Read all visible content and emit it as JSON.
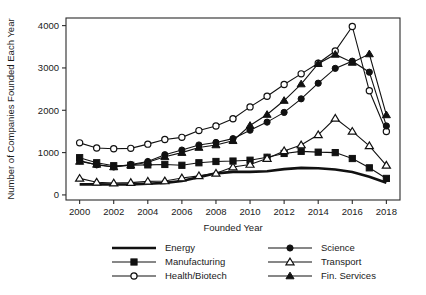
{
  "chart_data": {
    "type": "line",
    "title": "",
    "xlabel": "Founded Year",
    "ylabel": "Number of Companies Founded Each Year",
    "grid": false,
    "legend_position": "below-axes",
    "xlim": [
      1999.2,
      2018.8
    ],
    "ylim": [
      -120,
      4180
    ],
    "x": [
      2000,
      2001,
      2002,
      2003,
      2004,
      2005,
      2006,
      2007,
      2008,
      2009,
      2010,
      2011,
      2012,
      2013,
      2014,
      2015,
      2016,
      2017,
      2018
    ],
    "xticks": [
      2000,
      2002,
      2004,
      2006,
      2008,
      2010,
      2012,
      2014,
      2016,
      2018
    ],
    "xticklabels": [
      "2000",
      "2002",
      "2004",
      "2006",
      "2008",
      "2010",
      "2012",
      "2014",
      "2016",
      "2018"
    ],
    "yticks": [
      0,
      1000,
      2000,
      3000,
      4000
    ],
    "yticklabels": [
      "0",
      "1000",
      "2000",
      "3000",
      "4000"
    ],
    "series": [
      {
        "name": "Energy",
        "marker": "none",
        "marker_filled": false,
        "linewidth": "thick",
        "color": "#111111",
        "values": [
          250,
          250,
          245,
          250,
          265,
          285,
          330,
          420,
          510,
          545,
          545,
          560,
          610,
          640,
          630,
          600,
          540,
          430,
          290
        ]
      },
      {
        "name": "Manufacturing",
        "marker": "square",
        "marker_filled": true,
        "linewidth": "normal",
        "color": "#111111",
        "values": [
          880,
          760,
          690,
          700,
          710,
          720,
          700,
          760,
          790,
          800,
          820,
          890,
          980,
          1030,
          1010,
          1000,
          860,
          640,
          390
        ]
      },
      {
        "name": "Health/Biotech",
        "marker": "circle",
        "marker_filled": false,
        "linewidth": "normal",
        "color": "#111111",
        "values": [
          1230,
          1110,
          1090,
          1100,
          1200,
          1310,
          1360,
          1520,
          1630,
          1800,
          2080,
          2330,
          2610,
          2860,
          3110,
          3400,
          3980,
          2460,
          1500
        ]
      },
      {
        "name": "Science",
        "marker": "circle",
        "marker_filled": true,
        "linewidth": "normal",
        "color": "#111111",
        "values": [
          810,
          710,
          660,
          720,
          790,
          950,
          1060,
          1180,
          1240,
          1330,
          1530,
          1720,
          1950,
          2270,
          2640,
          2990,
          3160,
          2900,
          1630
        ]
      },
      {
        "name": "Transport",
        "marker": "triangle",
        "marker_filled": false,
        "linewidth": "normal",
        "color": "#111111",
        "values": [
          390,
          300,
          280,
          290,
          320,
          330,
          400,
          450,
          510,
          660,
          720,
          860,
          1040,
          1180,
          1420,
          1810,
          1500,
          1160,
          700
        ]
      },
      {
        "name": "Fin. Services",
        "marker": "triangle",
        "marker_filled": true,
        "linewidth": "normal",
        "color": "#111111",
        "values": [
          790,
          720,
          660,
          700,
          770,
          900,
          1000,
          1120,
          1180,
          1280,
          1640,
          1900,
          2230,
          2620,
          3100,
          3320,
          3130,
          3330,
          1890
        ]
      }
    ]
  },
  "legend": {
    "entries": [
      {
        "label": "Energy",
        "column": 0,
        "row": 0
      },
      {
        "label": "Manufacturing",
        "column": 0,
        "row": 1
      },
      {
        "label": "Health/Biotech",
        "column": 0,
        "row": 2
      },
      {
        "label": "Science",
        "column": 1,
        "row": 0
      },
      {
        "label": "Transport",
        "column": 1,
        "row": 1
      },
      {
        "label": "Fin. Services",
        "column": 1,
        "row": 2
      }
    ]
  }
}
